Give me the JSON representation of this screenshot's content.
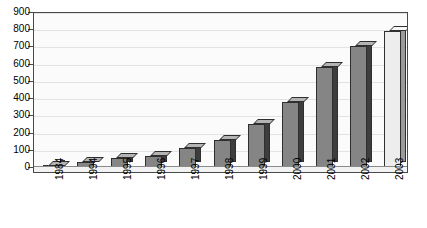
{
  "chart_data": {
    "type": "bar",
    "title": "",
    "subtitle": "",
    "xlabel": "",
    "ylabel": "",
    "categories": [
      "1984",
      "1994",
      "1995",
      "1996",
      "1997",
      "1998",
      "1999",
      "2000",
      "2001",
      "2002",
      "2003"
    ],
    "values": [
      5,
      30,
      50,
      65,
      110,
      155,
      250,
      380,
      580,
      700,
      790
    ],
    "series": [
      {
        "name": "",
        "values": [
          5,
          30,
          50,
          65,
          110,
          155,
          250,
          380,
          580,
          700,
          790
        ]
      }
    ],
    "ylim": [
      0,
      900
    ],
    "ytick_step": 100,
    "yticks": [
      0,
      100,
      200,
      300,
      400,
      500,
      600,
      700,
      800,
      900
    ],
    "ytick_labels": [
      "0",
      "100",
      "200",
      "300",
      "400",
      "500",
      "600",
      "700",
      "800",
      "900"
    ],
    "grid": true,
    "grid_axis": "y",
    "legend": false,
    "legend_position": "none",
    "style": "3d-column",
    "annotations": [],
    "colors": {
      "bar_front": "#858585",
      "bar_side": "#3d3d3d",
      "bar_top": "#b4b4b4",
      "bar_front_last": "#ededed",
      "bar_side_last": "#9a9a9a",
      "plot_background": "#fbfbfb",
      "axis": "#4a4a4a",
      "gridline": "#e3e3e3",
      "text": "#000000"
    },
    "xtick_rotation": -90
  }
}
